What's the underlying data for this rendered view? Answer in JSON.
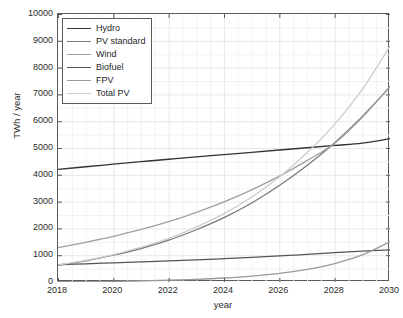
{
  "chart_data": {
    "type": "line",
    "title": "",
    "xlabel": "year",
    "ylabel": "TWh / year",
    "xlim": [
      2018,
      2030
    ],
    "ylim": [
      0,
      10000
    ],
    "xticks": [
      2018,
      2020,
      2022,
      2024,
      2026,
      2028,
      2030
    ],
    "yticks": [
      0,
      1000,
      2000,
      3000,
      4000,
      5000,
      6000,
      7000,
      8000,
      9000,
      10000
    ],
    "grid": true,
    "minor_grid": true,
    "legend_position": "upper left",
    "x": [
      2018,
      2019,
      2020,
      2021,
      2022,
      2023,
      2024,
      2025,
      2026,
      2027,
      2028,
      2029,
      2030
    ],
    "series": [
      {
        "name": "Hydro",
        "color": "#333333",
        "values": [
          4200,
          4300,
          4395,
          4490,
          4580,
          4670,
          4755,
          4840,
          4925,
          5010,
          5095,
          5180,
          5350
        ]
      },
      {
        "name": "PV standard",
        "color": "#7a7a7a",
        "values": [
          620,
          790,
          1000,
          1250,
          1560,
          1950,
          2400,
          2950,
          3600,
          4350,
          5200,
          6180,
          7280
        ]
      },
      {
        "name": "Wind",
        "color": "#a0a0a0",
        "values": [
          1280,
          1480,
          1700,
          1960,
          2250,
          2600,
          2990,
          3440,
          3950,
          4530,
          5180,
          6150,
          7300
        ]
      },
      {
        "name": "Biofuel",
        "color": "#555555",
        "values": [
          650,
          680,
          715,
          750,
          785,
          825,
          870,
          920,
          975,
          1030,
          1095,
          1150,
          1200
        ]
      },
      {
        "name": "FPV",
        "color": "#9a9a9a",
        "values": [
          10,
          15,
          25,
          40,
          65,
          100,
          150,
          220,
          320,
          470,
          690,
          1010,
          1500
        ]
      },
      {
        "name": "Total PV",
        "color": "#cccccc",
        "values": [
          630,
          805,
          1025,
          1290,
          1625,
          2050,
          2550,
          3170,
          3920,
          4820,
          5890,
          7190,
          8800
        ]
      }
    ]
  },
  "legend": {
    "items": [
      {
        "label": "Hydro"
      },
      {
        "label": "PV standard"
      },
      {
        "label": "Wind"
      },
      {
        "label": "Biofuel"
      },
      {
        "label": "FPV"
      },
      {
        "label": "Total PV"
      }
    ]
  },
  "axes": {
    "x_label": "year",
    "y_label": "TWh / year"
  },
  "style": {
    "axis_color": "#5a5a5a",
    "grid_color": "#e8e8e8",
    "minor_grid_color": "#f2f2f2",
    "background": "#ffffff",
    "text_color": "#2b2b2b"
  }
}
